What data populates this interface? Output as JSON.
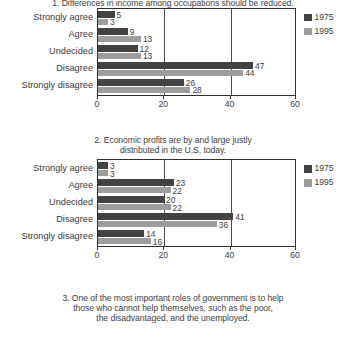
{
  "figure": {
    "series_labels": [
      "1975",
      "1995"
    ],
    "categories": [
      "Strongly agree",
      "Agree",
      "Undecided",
      "Disagree",
      "Strongly disagree"
    ],
    "axis_ticks": [
      "0",
      "20",
      "40",
      "60"
    ],
    "colors": {
      "series_1975": "#424242",
      "series_1995": "#9d9d9d",
      "frame": "#2e2e2e",
      "text": "#3a3a3a",
      "background": "#ffffff"
    }
  },
  "charts": [
    {
      "title": "1. Differences in income among occupations should be reduced.",
      "title_lines": [
        "1. Differences in income among occupations should be reduced."
      ],
      "values_1975": [
        5,
        9,
        12,
        47,
        26
      ],
      "values_1995": [
        3,
        13,
        13,
        44,
        28
      ]
    },
    {
      "title": "2. Economic profits are by and large justly distributed in the U.S. today.",
      "title_lines": [
        "2. Economic profits are by and large justly",
        "distributed in the U.S. today."
      ],
      "values_1975": [
        3,
        23,
        20,
        41,
        14
      ],
      "values_1995": [
        3,
        22,
        22,
        36,
        16
      ]
    },
    {
      "title": "3. One of the most important roles of government is to help those who cannot help themselves, such as the poor, the disadvantaged, and the unemployed.",
      "title_lines": [
        "3. One of the most important roles of government is to help",
        "those who cannot help themselves, such as the poor,",
        "the disadvantaged, and the unemployed."
      ],
      "values_1975": [],
      "values_1995": []
    }
  ],
  "chart_data": [
    {
      "type": "bar",
      "orientation": "horizontal",
      "title": "1. Differences in income among occupations should be reduced.",
      "categories": [
        "Strongly agree",
        "Agree",
        "Undecided",
        "Disagree",
        "Strongly disagree"
      ],
      "series": [
        {
          "name": "1975",
          "values": [
            5,
            9,
            12,
            47,
            26
          ]
        },
        {
          "name": "1995",
          "values": [
            3,
            13,
            13,
            44,
            28
          ]
        }
      ],
      "xlabel": "",
      "ylabel": "",
      "xlim": [
        0,
        60
      ],
      "xticks": [
        0,
        20,
        40,
        60
      ],
      "grid": true,
      "legend": "top-right",
      "data_labels": true
    },
    {
      "type": "bar",
      "orientation": "horizontal",
      "title": "2. Economic profits are by and large justly distributed in the U.S. today.",
      "categories": [
        "Strongly agree",
        "Agree",
        "Undecided",
        "Disagree",
        "Strongly disagree"
      ],
      "series": [
        {
          "name": "1975",
          "values": [
            3,
            23,
            20,
            41,
            14
          ]
        },
        {
          "name": "1995",
          "values": [
            3,
            22,
            22,
            36,
            16
          ]
        }
      ],
      "xlabel": "",
      "ylabel": "",
      "xlim": [
        0,
        60
      ],
      "xticks": [
        0,
        20,
        40,
        60
      ],
      "grid": true,
      "legend": "top-right",
      "data_labels": true
    },
    {
      "type": "bar",
      "orientation": "horizontal",
      "title": "3. One of the most important roles of government is to help those who cannot help themselves, such as the poor, the disadvantaged, and the unemployed.",
      "categories": [],
      "series": [],
      "note": "chart clipped below bottom edge of screenshot; only title visible"
    }
  ]
}
